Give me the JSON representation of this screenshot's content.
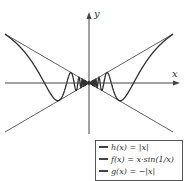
{
  "chart_data": {
    "type": "line",
    "title": "",
    "xlabel": "x",
    "ylabel": "y",
    "grid": false,
    "legend_position": "bottom-right",
    "xlim": [
      -0.6,
      0.6
    ],
    "ylim": [
      -0.4,
      0.45
    ],
    "series": [
      {
        "name": "h(x) = |x|",
        "expr": "abs(x)"
      },
      {
        "name": "f(x) = x·sin(1/x)",
        "expr": "x*sin(1/x)"
      },
      {
        "name": "g(x) = −|x|",
        "expr": "-abs(x)"
      }
    ]
  },
  "axes": {
    "x_label": "x",
    "y_label": "y"
  },
  "legend": {
    "items": [
      {
        "label": "h(x) = |x|"
      },
      {
        "label": "f(x) = x·sin(1/x)"
      },
      {
        "label": "g(x) = −|x|"
      }
    ]
  },
  "colors": {
    "line": "#333333",
    "axis": "#444444"
  }
}
